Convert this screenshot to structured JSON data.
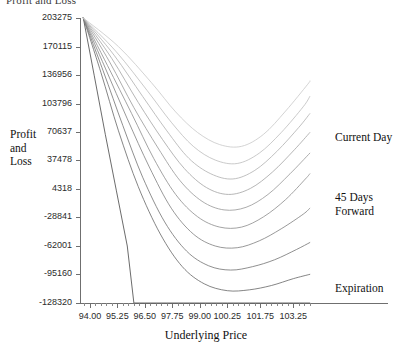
{
  "title_clipped": "Profit and Loss",
  "axes": {
    "ylabel_lines": [
      "Profit",
      "and",
      "Loss"
    ],
    "xlabel": "Underlying Price"
  },
  "annotations": {
    "current_day": "Current Day",
    "forward_line1": "45 Days",
    "forward_line2": "Forward",
    "expiration": "Expiration"
  },
  "chart_data": {
    "type": "line",
    "title": "Profit and Loss",
    "xlabel": "Underlying Price",
    "ylabel": "Profit and Loss",
    "xtick_labels": [
      "94.00",
      "95.25",
      "96.50",
      "97.75",
      "99.00",
      "100.25",
      "101.75",
      "103.25"
    ],
    "xtick_values": [
      94.0,
      95.25,
      96.5,
      97.75,
      99.0,
      100.25,
      101.75,
      103.25
    ],
    "ytick_labels": [
      "203275",
      "170115",
      "136956",
      "103796",
      "70637",
      "37478",
      "4318",
      "-28841",
      "-62001",
      "-95160",
      "-128320"
    ],
    "ytick_values": [
      203275,
      170115,
      136956,
      103796,
      70637,
      37478,
      4318,
      -28841,
      -62001,
      -95160,
      -128320
    ],
    "xlim": [
      93.55,
      104.1
    ],
    "ylim": [
      -128320,
      203275
    ],
    "grid": false,
    "legend": "inline-right-annotations",
    "series": [
      {
        "name": "Expiration",
        "annotation": "Expiration",
        "x": [
          93.7,
          94.2,
          94.7,
          95.2,
          95.7,
          96.0,
          96.5,
          97.5,
          99.0,
          100.25,
          101.75,
          103.25,
          104.0
        ],
        "y": [
          203275,
          136000,
          68000,
          3000,
          -62000,
          -128320,
          -128320,
          -128320,
          -128320,
          -128320,
          -128320,
          -128320,
          -128320
        ]
      },
      {
        "name": "Curve 2",
        "x": [
          93.7,
          94.5,
          95.3,
          96.2,
          97.2,
          98.2,
          99.2,
          100.25,
          101.25,
          102.25,
          103.25,
          104.0
        ],
        "y": [
          203275,
          140000,
          72000,
          7000,
          -48000,
          -86000,
          -106000,
          -114000,
          -113000,
          -108000,
          -100000,
          -95000
        ]
      },
      {
        "name": "Curve 3",
        "x": [
          93.7,
          94.6,
          95.5,
          96.4,
          97.4,
          98.4,
          99.4,
          100.4,
          101.4,
          102.4,
          103.4,
          104.0
        ],
        "y": [
          203275,
          142000,
          78000,
          18000,
          -34000,
          -68000,
          -85000,
          -90000,
          -86000,
          -78000,
          -66000,
          -58000
        ]
      },
      {
        "name": "Curve 4",
        "x": [
          93.7,
          94.7,
          95.7,
          96.7,
          97.7,
          98.7,
          99.7,
          100.7,
          101.7,
          102.7,
          103.7,
          104.0
        ],
        "y": [
          203275,
          145000,
          86000,
          30000,
          -18000,
          -48000,
          -62000,
          -64000,
          -56000,
          -42000,
          -25000,
          -18000
        ]
      },
      {
        "name": "Curve 5",
        "x": [
          93.7,
          94.8,
          95.9,
          96.9,
          97.9,
          98.9,
          99.9,
          100.9,
          101.9,
          102.9,
          103.8,
          104.0
        ],
        "y": [
          203275,
          148000,
          92000,
          40000,
          -2000,
          -28000,
          -40000,
          -40000,
          -28000,
          -8000,
          16000,
          22000
        ]
      },
      {
        "name": "45 Days Forward",
        "annotation": "45 Days Forward",
        "x": [
          93.7,
          94.9,
          96.0,
          97.1,
          98.1,
          99.1,
          100.1,
          101.1,
          102.1,
          103.1,
          104.0
        ],
        "y": [
          203275,
          152000,
          99000,
          52000,
          14000,
          -10000,
          -20000,
          -17000,
          -2000,
          22000,
          46000
        ]
      },
      {
        "name": "Curve 7",
        "x": [
          93.7,
          95.0,
          96.2,
          97.3,
          98.3,
          99.3,
          100.3,
          101.3,
          102.3,
          103.3,
          104.0
        ],
        "y": [
          203275,
          156000,
          105000,
          62000,
          28000,
          6000,
          -2000,
          5000,
          24000,
          50000,
          70000
        ]
      },
      {
        "name": "Curve 8",
        "x": [
          93.7,
          95.1,
          96.4,
          97.5,
          98.5,
          99.5,
          100.5,
          101.5,
          102.5,
          103.5,
          104.0
        ],
        "y": [
          203275,
          160000,
          112000,
          72000,
          40000,
          22000,
          16000,
          26000,
          48000,
          76000,
          92000
        ]
      },
      {
        "name": "Curve 9",
        "x": [
          93.7,
          95.2,
          96.6,
          97.7,
          98.7,
          99.7,
          100.7,
          101.7,
          102.7,
          103.7,
          104.0
        ],
        "y": [
          203275,
          164000,
          119000,
          82000,
          54000,
          38000,
          34000,
          46000,
          70000,
          100000,
          112000
        ]
      },
      {
        "name": "Current Day",
        "annotation": "Current Day",
        "x": [
          93.7,
          95.3,
          96.8,
          97.9,
          98.9,
          99.9,
          100.9,
          101.9,
          102.9,
          103.9,
          104.0
        ],
        "y": [
          203275,
          170000,
          128000,
          94000,
          70000,
          56000,
          54000,
          68000,
          95000,
          126000,
          130000
        ]
      }
    ]
  },
  "layout": {
    "plot_left": 80,
    "plot_top": 18,
    "plot_right": 312,
    "plot_bottom": 303,
    "axis_extend_right": 388
  }
}
